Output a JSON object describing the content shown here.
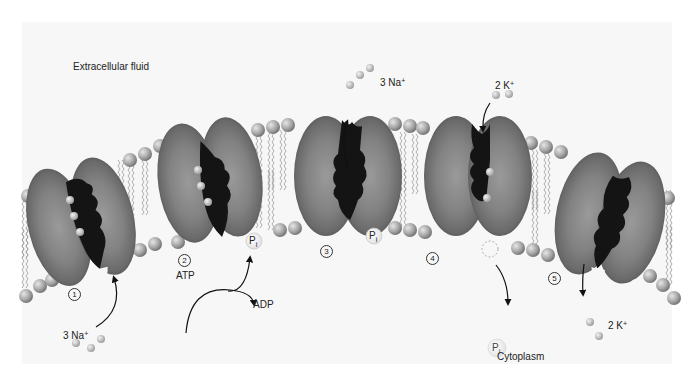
{
  "regions": {
    "extracellular": "Extracellular fluid",
    "cytoplasm": "Cytoplasm"
  },
  "steps": [
    {
      "number": "1",
      "symbol": "①",
      "ion_label": "3 Na",
      "charge": "+",
      "description": "3 Na+ bind from cytoplasm"
    },
    {
      "number": "2",
      "symbol": "②",
      "reactant": "ATP",
      "product": "ADP",
      "phosphate": "Pi",
      "description": "ATP phosphorylates pump"
    },
    {
      "number": "3",
      "symbol": "③",
      "ion_label": "3 Na",
      "charge": "+",
      "phosphate": "Pi",
      "description": "3 Na+ released to extracellular fluid"
    },
    {
      "number": "4",
      "symbol": "④",
      "ion_label": "2 K",
      "charge": "+",
      "phosphate": "Pi",
      "description": "2 K+ bind; Pi released"
    },
    {
      "number": "5",
      "symbol": "⑤",
      "ion_label": "2 K",
      "charge": "+",
      "description": "2 K+ released to cytoplasm"
    }
  ],
  "phosphate": {
    "base": "P",
    "sub": "i"
  },
  "colors": {
    "protein": "#7a7a7a",
    "channel": "#141414",
    "lipid_head": "#a8a8a8",
    "ion": "#c4c4c4",
    "background": "#f7f7f7"
  }
}
